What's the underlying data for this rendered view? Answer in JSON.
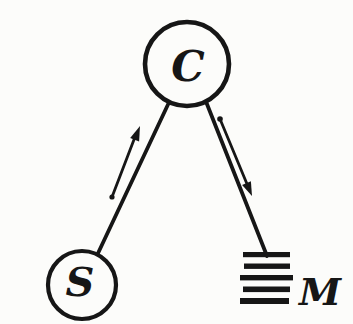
{
  "page": {
    "background_color": "#fcfcfa",
    "ink_color": "#161616",
    "style": "scanned hand-drawn diagram"
  },
  "diagram": {
    "type": "node-link-diagram",
    "nodes": [
      {
        "id": "C",
        "label": "C",
        "shape": "circle",
        "position": "top-center"
      },
      {
        "id": "S",
        "label": "S",
        "shape": "circle",
        "position": "bottom-left"
      },
      {
        "id": "M",
        "label": "M",
        "shape": "hatched-bars",
        "position": "bottom-right"
      }
    ],
    "edges": [
      {
        "from": "S",
        "to": "C",
        "arrow_direction": "toward-C"
      },
      {
        "from": "C",
        "to": "M",
        "arrow_direction": "toward-M"
      }
    ]
  }
}
